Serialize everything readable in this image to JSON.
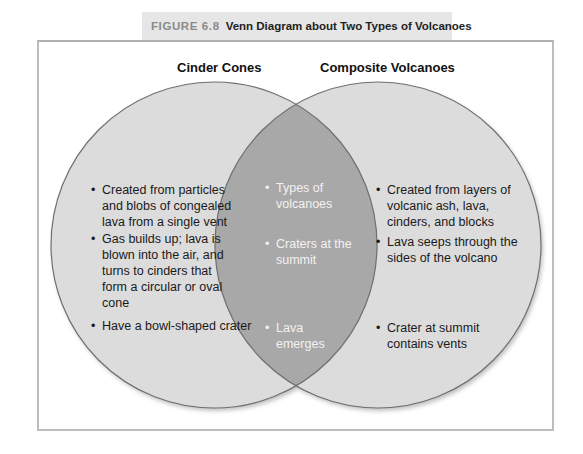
{
  "caption": {
    "figure_number": "FIGURE 6.8",
    "title": "Venn Diagram about Two Types of Volcanoes"
  },
  "colors": {
    "circle_fill": "#dcdcdc",
    "overlap_fill": "#a8a8a8",
    "circle_stroke": "#6e6e6e",
    "caption_bg": "#e6e6e6",
    "frame_border": "#bdbdbd"
  },
  "venn": {
    "left": {
      "heading": "Cinder Cones",
      "items": [
        "Created from particles and blobs of congealed lava from a single vent",
        "Gas builds up; lava is blown into the air, and turns to cinders that form a circular or oval cone",
        "Have a bowl-shaped crater"
      ]
    },
    "overlap": {
      "items": [
        "Types of volcanoes",
        "Craters at the summit",
        "Lava emerges"
      ]
    },
    "right": {
      "heading": "Composite Volcanoes",
      "items": [
        "Created from layers of volcanic ash, lava, cinders, and blocks",
        "Lava seeps through the sides of the volcano",
        "Crater at summit contains vents"
      ]
    }
  }
}
